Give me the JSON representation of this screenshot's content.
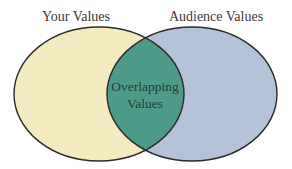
{
  "diagram": {
    "type": "venn",
    "sets": [
      {
        "label": "Your Values",
        "color": "#f4eac0"
      },
      {
        "label": "Audience Values",
        "color": "#b4c2da"
      }
    ],
    "intersection": {
      "lines": [
        "Overlapping",
        "Values"
      ],
      "color": "#4e9a89"
    },
    "stroke_color": "#2b2b2b"
  }
}
